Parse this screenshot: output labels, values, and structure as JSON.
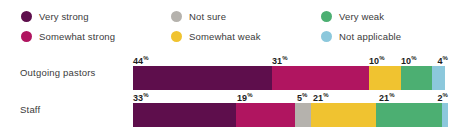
{
  "legend": {
    "columns": [
      {
        "items": [
          {
            "label": "Very strong",
            "color": "#5E0E4C",
            "icon": "legend-dot-icon"
          },
          {
            "label": "Somewhat strong",
            "color": "#B01560",
            "icon": "legend-dot-icon"
          }
        ]
      },
      {
        "items": [
          {
            "label": "Not sure",
            "color": "#B5B2AD",
            "icon": "legend-dot-icon"
          },
          {
            "label": "Somewhat weak",
            "color": "#F0C330",
            "icon": "legend-dot-icon"
          }
        ]
      },
      {
        "items": [
          {
            "label": "Very weak",
            "color": "#4CAF72",
            "icon": "legend-dot-icon"
          },
          {
            "label": "Not applicable",
            "color": "#8CC8DC",
            "icon": "legend-dot-icon"
          }
        ]
      }
    ]
  },
  "chart_data": {
    "type": "bar",
    "orientation": "horizontal",
    "stacked": true,
    "normalized": true,
    "title": "",
    "xlabel": "",
    "ylabel": "",
    "xlim": [
      0,
      100
    ],
    "grid": false,
    "legend_position": "top",
    "categories": [
      "Outgoing pastors",
      "Staff"
    ],
    "series": [
      {
        "name": "Very strong",
        "color": "#5E0E4C",
        "values": [
          44,
          33
        ]
      },
      {
        "name": "Somewhat strong",
        "color": "#B01560",
        "values": [
          31,
          19
        ]
      },
      {
        "name": "Not sure",
        "color": "#B5B2AD",
        "values": [
          0,
          5
        ]
      },
      {
        "name": "Somewhat weak",
        "color": "#F0C330",
        "values": [
          10,
          21
        ]
      },
      {
        "name": "Very weak",
        "color": "#4CAF72",
        "values": [
          10,
          21
        ]
      },
      {
        "name": "Not applicable",
        "color": "#8CC8DC",
        "values": [
          4,
          2
        ]
      }
    ],
    "rows": [
      {
        "label": "Outgoing pastors",
        "segments": [
          {
            "name": "Very strong",
            "value": 44,
            "label": "44",
            "suffix": "%",
            "color": "#5E0E4C",
            "show_label": true
          },
          {
            "name": "Somewhat strong",
            "value": 31,
            "label": "31",
            "suffix": "%",
            "color": "#B01560",
            "show_label": true
          },
          {
            "name": "Not sure",
            "value": 0,
            "label": "",
            "suffix": "%",
            "color": "#B5B2AD",
            "show_label": false
          },
          {
            "name": "Somewhat weak",
            "value": 10,
            "label": "10",
            "suffix": "%",
            "color": "#F0C330",
            "show_label": true
          },
          {
            "name": "Very weak",
            "value": 10,
            "label": "10",
            "suffix": "%",
            "color": "#4CAF72",
            "show_label": true
          },
          {
            "name": "Not applicable",
            "value": 4,
            "label": "4",
            "suffix": "%",
            "color": "#8CC8DC",
            "show_label": true
          }
        ]
      },
      {
        "label": "Staff",
        "segments": [
          {
            "name": "Very strong",
            "value": 33,
            "label": "33",
            "suffix": "%",
            "color": "#5E0E4C",
            "show_label": true
          },
          {
            "name": "Somewhat strong",
            "value": 19,
            "label": "19",
            "suffix": "%",
            "color": "#B01560",
            "show_label": true
          },
          {
            "name": "Not sure",
            "value": 5,
            "label": "5",
            "suffix": "%",
            "color": "#B5B2AD",
            "show_label": true
          },
          {
            "name": "Somewhat weak",
            "value": 21,
            "label": "21",
            "suffix": "%",
            "color": "#F0C330",
            "show_label": true
          },
          {
            "name": "Very weak",
            "value": 21,
            "label": "21",
            "suffix": "%",
            "color": "#4CAF72",
            "show_label": true
          },
          {
            "name": "Not applicable",
            "value": 2,
            "label": "2",
            "suffix": "%",
            "color": "#8CC8DC",
            "show_label": true
          }
        ]
      }
    ]
  }
}
